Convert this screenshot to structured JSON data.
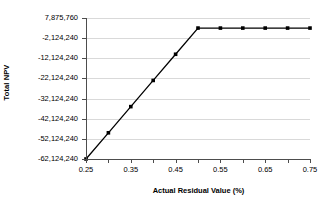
{
  "chart_data": {
    "type": "line",
    "title": "",
    "xlabel": "Actual Residual Value (%)",
    "ylabel": "Total NPV",
    "xlim": [
      0.25,
      0.75
    ],
    "ylim": [
      -62124240,
      7875760
    ],
    "grid": true,
    "legend": "none",
    "x_tick_labels": [
      "0.25",
      "0.35",
      "0.45",
      "0.55",
      "0.65",
      "0.75"
    ],
    "x_tick_values": [
      0.25,
      0.35,
      0.45,
      0.55,
      0.65,
      0.75
    ],
    "x_minor_tick_values": [
      0.25,
      0.3,
      0.35,
      0.4,
      0.45,
      0.5,
      0.55,
      0.6,
      0.65,
      0.7,
      0.75
    ],
    "y_tick_labels": [
      "7,875,760",
      "-2,124,240",
      "-12,124,240",
      "-22,124,240",
      "-32,124,240",
      "-42,124,240",
      "-52,124,240",
      "-62,124,240"
    ],
    "y_tick_values": [
      7875760,
      -2124240,
      -12124240,
      -22124240,
      -32124240,
      -42124240,
      -52124240,
      -62124240
    ],
    "series": [
      {
        "name": "Total NPV",
        "marker": "filled-diamond",
        "color": "#000000",
        "x": [
          0.25,
          0.3,
          0.35,
          0.4,
          0.45,
          0.5,
          0.55,
          0.6,
          0.65,
          0.7,
          0.75
        ],
        "values": [
          -62124240,
          -49124240,
          -36124240,
          -23124240,
          -10124240,
          2875760,
          2875760,
          2875760,
          2875760,
          2875760,
          2875760
        ]
      }
    ]
  },
  "axes": {
    "y_title": "Total NPV",
    "x_title": "Actual Residual Value (%)"
  },
  "colors": {
    "series": "#000000",
    "grid": "#d9d9d9",
    "axis": "#4d4d4d",
    "background": "#ffffff"
  }
}
